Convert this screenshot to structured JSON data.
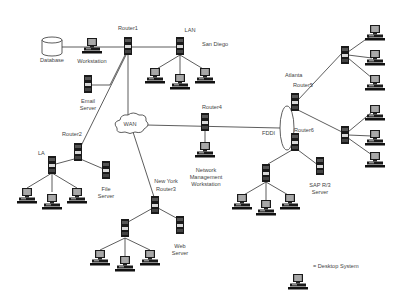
{
  "labels": {
    "database": "Database",
    "workstation": "Workstation",
    "router1": "Router1",
    "lan": "LAN",
    "san_diego": "San Diego",
    "email_server_1": "Email",
    "email_server_2": "Server",
    "wan": "WAN",
    "router2": "Router2",
    "la": "LA",
    "file_server_1": "File",
    "file_server_2": "Server",
    "router4": "Router4",
    "nmw_1": "Network",
    "nmw_2": "Management",
    "nmw_3": "Workstation",
    "new_york": "New York",
    "router3": "Router3",
    "web_server_1": "Web",
    "web_server_2": "Server",
    "atlanta": "Atlanta",
    "router5": "Router5",
    "fddi": "FDDI",
    "router6": "Router6",
    "sap_1": "SAP R/3",
    "sap_2": "Server",
    "legend": "= Desktop System"
  },
  "colors": {
    "line": "#333333",
    "device_dark": "#1a1a1a",
    "device_light": "#d8d8d8",
    "screen": "#9a9a9a"
  }
}
